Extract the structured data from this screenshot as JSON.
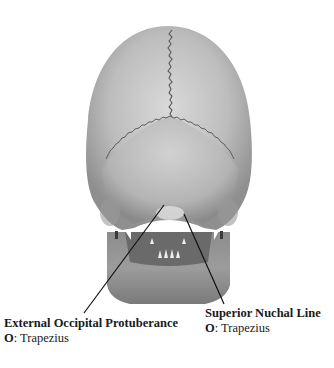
{
  "figure": {
    "labels": [
      {
        "id": "external-occipital-protuberance",
        "title": "External Occipital Protuberance",
        "attachment_prefix": "O",
        "attachment_sep": ": ",
        "attachment_value": "Trapezius"
      },
      {
        "id": "superior-nuchal-line",
        "title": "Superior Nuchal Line",
        "attachment_prefix": "O",
        "attachment_sep": ": ",
        "attachment_value": "Trapezius"
      }
    ],
    "colors": {
      "bone_light": "#cfcfcf",
      "bone_mid": "#a9a9a9",
      "bone_dark": "#6e6e6e",
      "suture": "#5a5a5a",
      "leader_line": "#111111",
      "text": "#1a1a1a"
    }
  }
}
